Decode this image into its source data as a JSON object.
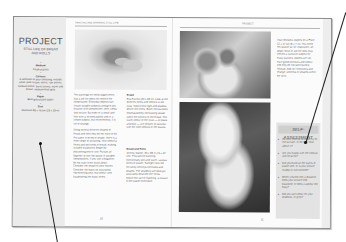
{
  "document": {
    "type": "book spread",
    "left_page": {
      "sidebar": {
        "title": "PROJECT",
        "subtitle_line1": "STILL LIFE OF BREAD",
        "subtitle_line2": "AND ROLLS",
        "materials": [
          {
            "label": "Medium",
            "value": "Chalk pastels"
          },
          {
            "label": "Colours",
            "value": "A selection of your choosing, include white, pale cream, ochre, raw sienna, medium ochre, burnt sienna, warm and brown, medium blue-grey"
          },
          {
            "label": "Paper",
            "value": "Blue-grey pastel paper"
          },
          {
            "label": "Size",
            "value": "Minimum 38 x 46 cm (15 x 18 in)"
          }
        ]
      },
      "header_text": "PAINTING AND DRAWING STILL LIFE",
      "body_text": [
        "The paintings on these pages show that a still life does not need to be complicated. Everyday objects can create suitable subjects and give you practice with composition, tone, colour and texture. By order of a small and little over a formed palette and in a simple subject, but nevertheless, it is full of change.",
        "Using several different shapes of bread and rolls they do not have to be the same in terms of shape: there is a wide range of attracting, very colourful forms and soft ends in bread, making suitable sculptures. Begin by positioning one or two. Pursue all together to see the space in suitable compositions. If you use a baguette, do not want to be stuck about. Consider the shape of your loaves. Consider the basic so accurately, representing your real colour, and establishing the basic forms."
      ],
      "page_number": "10"
    },
    "middle_column": {
      "caption1": {
        "title": "Bread",
        "text": "Rita Farrow (20 x 28 in). Look at the different tones and colours in the crust. Notice how light and shadow define the forms. Each roll has been emphasised by contrasting shade within the context of the bread. The warm colour of the crust — of black and blue — are chosen to connect with the cool colours of the loaves."
      },
      "caption2": {
        "title": "Bread and Rolls",
        "text": "Jeremy Galton, 30 x 38 in (76 x 97 cm). This still-life painting. Intentionally soft and warm, various tones of pastel. Sunlight from the left softly conveys contrasts and shapes. The shadows are bold yet accurately describe the forms. Notice the use of hatching, a feature of the pastel technique."
      }
    },
    "right_page": {
      "header_text": "PROJECT",
      "side_text": "Jean Winslow. Apples on a Plate 12 x 17 cm (5 x 7 in). You need not search far for inspiration; an apple, bowl or still life idea may well be a favourite subject for many painters. Apples are fun, have good contours and colour, and they do not spoil quickly. Instead, look for reflections and change, softness or shapes within the form.",
      "page_number": "11",
      "self_assessment": {
        "title": "SELF-ASSESSMENT",
        "items": [
          "Do your objects sit properly on the surface, or do they float above it?",
          "Are you happy with the colours and textures?",
          "Did you build up the layers of pastel well, or is your picture muddy or overworked?",
          "When viewed from a distance, does your picture look balanced, or does it appear too busy?",
          "Did you use colour for your shadows, or grey?"
        ]
      }
    }
  }
}
